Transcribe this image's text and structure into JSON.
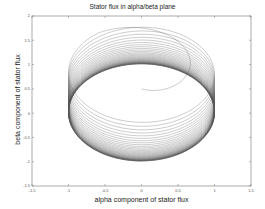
{
  "chart_data": {
    "type": "line",
    "title": "Stator flux in alpha/beta plane",
    "xlabel": "alpha component of stator flux",
    "ylabel": "beta component of stator flux",
    "xlim": [
      -1.5,
      1.5
    ],
    "ylim": [
      -1.5,
      2
    ],
    "xticks": [
      -1.5,
      -1,
      -0.5,
      0,
      0.5,
      1,
      1.5
    ],
    "xtick_labels": [
      "-1.5",
      "-1",
      "-0.5",
      "0",
      "0.5",
      "1",
      "1.5"
    ],
    "yticks": [
      -1.5,
      -1,
      -0.5,
      0,
      0.5,
      1,
      1.5,
      2
    ],
    "ytick_labels": [
      "-1.5",
      "-1",
      "-0.5",
      "0",
      "0.5",
      "1",
      "1.5",
      "2"
    ],
    "grid": false,
    "legend": null,
    "series": [
      {
        "name": "stator flux trajectory",
        "description": "Spiral of near-circular loops starting at (0,0); loop centers drift from beta≈0.9 down to 0 while converging to the unit circle (radius ≈ 1)",
        "start": [
          0,
          0
        ],
        "steady_state_radius": 1.0,
        "loop_center_beta_start": 0.9,
        "loop_center_beta_end": 0.0,
        "loop_count_visible": 40,
        "line_color": "#555555"
      }
    ]
  },
  "colors": {
    "trace": "#555555",
    "axes": "#888888",
    "background": "#ffffff"
  }
}
